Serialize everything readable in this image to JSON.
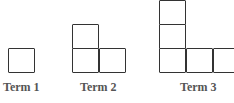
{
  "terms": [
    {
      "label": "Term 1",
      "squares": 1
    },
    {
      "label": "Term 2",
      "squares": 3
    },
    {
      "label": "Term 3",
      "squares": 5
    }
  ],
  "colors": {
    "stroke": "#333333",
    "label": "#555555"
  }
}
